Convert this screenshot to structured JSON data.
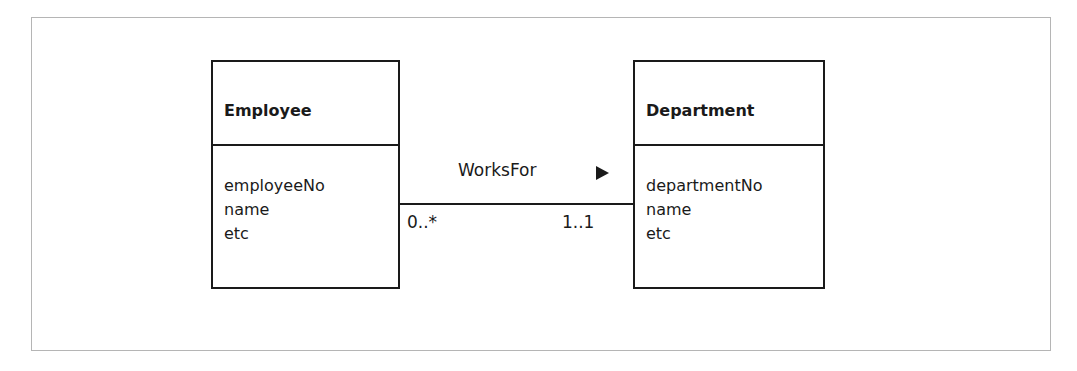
{
  "diagram": {
    "entities": [
      {
        "name": "Employee",
        "attributes": [
          "employeeNo",
          "name",
          "etc"
        ]
      },
      {
        "name": "Department",
        "attributes": [
          "departmentNo",
          "name",
          "etc"
        ]
      }
    ],
    "relationship": {
      "name": "WorksFor",
      "direction_icon": "triangle-right",
      "source_multiplicity": "0..*",
      "target_multiplicity": "1..1"
    }
  }
}
